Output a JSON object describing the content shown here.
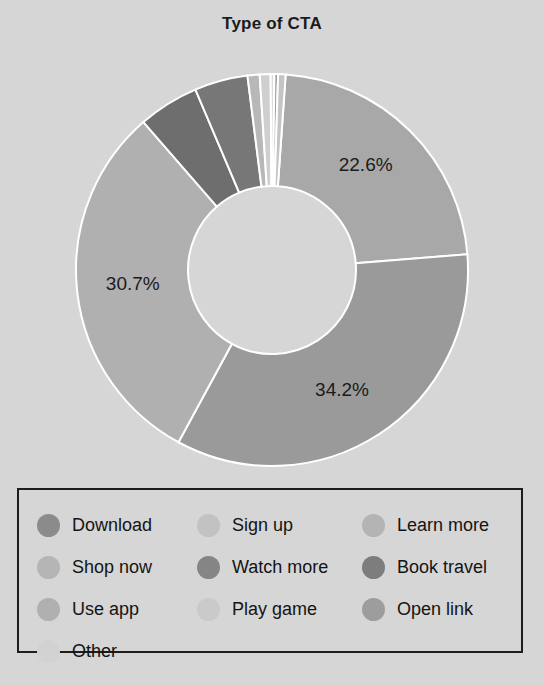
{
  "header": {
    "title": "Type of CTA"
  },
  "chart_data": {
    "type": "pie",
    "variant": "donut",
    "title": "Type of CTA",
    "xlabel": "",
    "ylabel": "",
    "legend_position": "bottom",
    "grid": false,
    "hole_ratio": 0.43,
    "background_color": "#d6d6d6",
    "labels": [
      "Download",
      "Sign up",
      "Learn more",
      "Shop now",
      "Watch more",
      "Book travel",
      "Use app",
      "Play game",
      "Open link",
      "Other"
    ],
    "values": [
      34.2,
      0.6,
      22.6,
      30.7,
      4.4,
      5.0,
      1.0,
      0.9,
      0.3,
      0.3
    ],
    "colors": [
      "#9a9a9a",
      "#c4c4c4",
      "#a8a8a8",
      "#b0b0b0",
      "#777777",
      "#6e6e6e",
      "#b8b8b8",
      "#cfcfcf",
      "#9f9f9f",
      "#dcdcdc"
    ],
    "visible_data_labels": [
      {
        "text": "34.2%",
        "slice": "Download"
      },
      {
        "text": "30.7%",
        "slice": "Shop now"
      },
      {
        "text": "22.6%",
        "slice": "Learn more"
      }
    ],
    "slice_separator_color": "#ffffff"
  },
  "donut": {
    "center_x": 272,
    "center_y": 220,
    "outer_radius": 196,
    "inner_radius": 84,
    "slices": [
      {
        "name": "learn-more",
        "start": 4.0,
        "end": 85.4,
        "color": "#a8a8a8",
        "label": "22.6%",
        "label_r": 140,
        "label_angle": 42
      },
      {
        "name": "download",
        "start": 85.4,
        "end": 208.5,
        "color": "#9a9a9a",
        "label": "34.2%",
        "label_r": 140,
        "label_angle": 150
      },
      {
        "name": "shop-now",
        "start": 208.5,
        "end": 319.0,
        "color": "#b0b0b0",
        "label": "30.7%",
        "label_r": 140,
        "label_angle": 264
      },
      {
        "name": "book-travel",
        "start": 319.0,
        "end": 337.0,
        "color": "#6e6e6e",
        "label": "",
        "label_r": 0,
        "label_angle": 0
      },
      {
        "name": "watch-more",
        "start": 337.0,
        "end": 352.8,
        "color": "#777777",
        "label": "",
        "label_r": 0,
        "label_angle": 0
      },
      {
        "name": "use-app",
        "start": 352.8,
        "end": 356.4,
        "color": "#b8b8b8",
        "label": "",
        "label_r": 0,
        "label_angle": 0
      },
      {
        "name": "play-game",
        "start": 356.4,
        "end": 359.6,
        "color": "#cfcfcf",
        "label": "",
        "label_r": 0,
        "label_angle": 0
      },
      {
        "name": "other",
        "start": 359.6,
        "end": 360.7,
        "color": "#dcdcdc",
        "label": "",
        "label_r": 0,
        "label_angle": 0
      },
      {
        "name": "open-link",
        "start": 360.7,
        "end": 361.8,
        "color": "#9f9f9f",
        "label": "",
        "label_r": 0,
        "label_angle": 0
      },
      {
        "name": "sign-up",
        "start": 361.8,
        "end": 364.0,
        "color": "#c4c4c4",
        "label": "",
        "label_r": 0,
        "label_angle": 0
      }
    ]
  },
  "legend": {
    "items": [
      {
        "label": "Download",
        "color": "#8b8b8b"
      },
      {
        "label": "Sign up",
        "color": "#c2c2c2"
      },
      {
        "label": "Learn more",
        "color": "#b4b4b4"
      },
      {
        "label": "Shop now",
        "color": "#b5b5b5"
      },
      {
        "label": "Watch more",
        "color": "#858585"
      },
      {
        "label": "Book travel",
        "color": "#7d7d7d"
      },
      {
        "label": "Use app",
        "color": "#b0b0b0"
      },
      {
        "label": "Play game",
        "color": "#cacaca"
      },
      {
        "label": "Open link",
        "color": "#9d9d9d"
      },
      {
        "label": "Other",
        "color": "#d2d2d2"
      }
    ]
  }
}
